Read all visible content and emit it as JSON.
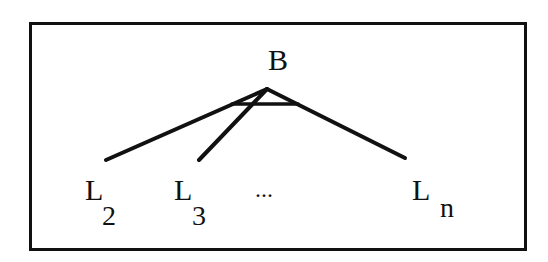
{
  "diagram": {
    "root": {
      "label": "B"
    },
    "children": [
      {
        "label": "L",
        "subscript": "2"
      },
      {
        "label": "L",
        "subscript": "3"
      },
      {
        "ellipsis": "..."
      },
      {
        "label": "L",
        "subscript": "n"
      }
    ],
    "colors": {
      "stroke": "#111111",
      "background": "#ffffff"
    }
  }
}
